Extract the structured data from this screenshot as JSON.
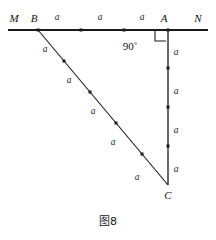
{
  "figure": {
    "caption": "图8",
    "vertices": [
      {
        "name": "M",
        "label": "M",
        "x": 14,
        "y": 22
      },
      {
        "name": "B",
        "label": "B",
        "x": 34,
        "y": 22
      },
      {
        "name": "A",
        "label": "A",
        "x": 164,
        "y": 22
      },
      {
        "name": "N",
        "label": "N",
        "x": 198,
        "y": 22
      },
      {
        "name": "C",
        "label": "C",
        "x": 168,
        "y": 199
      }
    ],
    "angle": {
      "label": "90˚",
      "value": "90",
      "x": 130,
      "y": 50,
      "at_vertex": "A"
    },
    "lines": {
      "mn": {
        "x1": 8,
        "y1": 30,
        "x2": 208,
        "y2": 30,
        "width": 2.2
      },
      "ac": {
        "x1": 168,
        "y1": 30,
        "x2": 168,
        "y2": 185,
        "width": 1.3
      },
      "bc": {
        "x1": 38,
        "y1": 30,
        "x2": 168,
        "y2": 185,
        "width": 1.1
      }
    },
    "right_angle_mark": {
      "x": 155,
      "y": 30,
      "size": 11
    },
    "dots": {
      "size": 3.0,
      "mn": [
        {
          "x": 38,
          "y": 30
        },
        {
          "x": 81,
          "y": 30
        },
        {
          "x": 124,
          "y": 30
        },
        {
          "x": 168,
          "y": 30
        }
      ],
      "ac": [
        {
          "x": 168,
          "y": 68
        },
        {
          "x": 168,
          "y": 107
        },
        {
          "x": 168,
          "y": 146
        }
      ],
      "bc": [
        {
          "x": 64,
          "y": 61
        },
        {
          "x": 90,
          "y": 92
        },
        {
          "x": 116,
          "y": 123
        },
        {
          "x": 142,
          "y": 154
        }
      ]
    },
    "segment_labels": {
      "value": "a",
      "mn": [
        {
          "x": 57,
          "y": 20
        },
        {
          "x": 100,
          "y": 20
        },
        {
          "x": 142,
          "y": 20
        }
      ],
      "ac": [
        {
          "x": 176,
          "y": 55
        },
        {
          "x": 176,
          "y": 94
        },
        {
          "x": 176,
          "y": 133
        },
        {
          "x": 176,
          "y": 172
        }
      ],
      "bc": [
        {
          "x": 45,
          "y": 52
        },
        {
          "x": 69,
          "y": 83
        },
        {
          "x": 93,
          "y": 114
        },
        {
          "x": 113,
          "y": 145
        },
        {
          "x": 137,
          "y": 180
        }
      ]
    },
    "colors": {
      "stroke": "#1a1a1a",
      "background": "#ffffff",
      "text": "#111111"
    }
  }
}
